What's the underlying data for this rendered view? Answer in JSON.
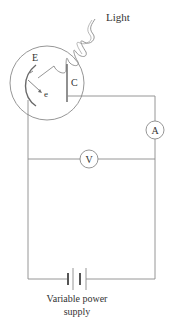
{
  "labels": {
    "light": "Light",
    "emitter": "E",
    "collector": "C",
    "electron": "e",
    "ammeter": "A",
    "voltmeter": "V",
    "supply_line1": "Variable power",
    "supply_line2": "supply"
  },
  "colors": {
    "line": "#8a8a8a",
    "text": "#333333",
    "background": "#ffffff"
  },
  "components": [
    {
      "id": "phototube",
      "type": "vacuum tube",
      "contains": [
        "emitter E",
        "collector C"
      ]
    },
    {
      "id": "ammeter",
      "symbol": "A",
      "placement": "right branch, series"
    },
    {
      "id": "voltmeter",
      "symbol": "V",
      "placement": "across circuit, parallel"
    },
    {
      "id": "power-supply",
      "symbol": "battery",
      "label": "Variable power supply"
    }
  ]
}
